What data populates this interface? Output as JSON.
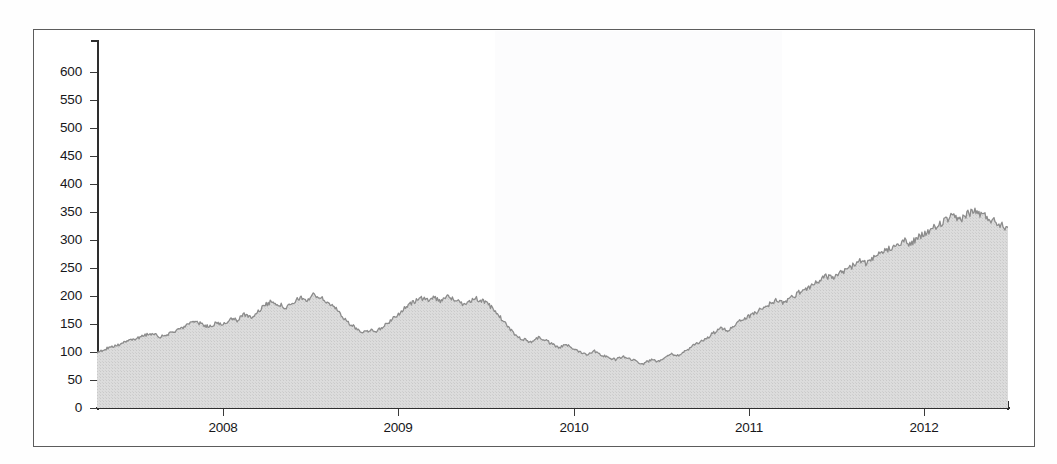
{
  "figure": {
    "background_color": "#ffffff",
    "frame_color": "#5c5c5c",
    "axis_color": "#2e2e2e"
  },
  "chart_data": {
    "type": "area",
    "title": "",
    "subtitle": "",
    "xlabel": "",
    "ylabel": "",
    "grid": false,
    "legend_position": "none",
    "fill_color": "#d6d6d6",
    "line_color": "#8c8c8c",
    "xlim": [
      2007.28,
      2012.48
    ],
    "ylim": [
      0,
      650
    ],
    "ytick_labels": [
      "0",
      "50",
      "100",
      "150",
      "200",
      "250",
      "300",
      "350",
      "400",
      "450",
      "500",
      "550",
      "600"
    ],
    "ytick_values": [
      0,
      50,
      100,
      150,
      200,
      250,
      300,
      350,
      400,
      450,
      500,
      550,
      600
    ],
    "xtick_labels": [
      "2008",
      "2009",
      "2010",
      "2011",
      "2012"
    ],
    "xtick_values": [
      2008,
      2009,
      2010,
      2011,
      2012
    ],
    "series": [
      {
        "name": "index",
        "x": [
          2007.28,
          2007.32,
          2007.36,
          2007.4,
          2007.44,
          2007.48,
          2007.52,
          2007.56,
          2007.6,
          2007.64,
          2007.68,
          2007.72,
          2007.76,
          2007.8,
          2007.84,
          2007.88,
          2007.92,
          2007.96,
          2008.0,
          2008.04,
          2008.08,
          2008.12,
          2008.16,
          2008.2,
          2008.24,
          2008.28,
          2008.32,
          2008.36,
          2008.4,
          2008.44,
          2008.48,
          2008.52,
          2008.56,
          2008.6,
          2008.64,
          2008.68,
          2008.72,
          2008.76,
          2008.8,
          2008.84,
          2008.88,
          2008.92,
          2008.96,
          2009.0,
          2009.04,
          2009.08,
          2009.12,
          2009.16,
          2009.2,
          2009.24,
          2009.28,
          2009.32,
          2009.36,
          2009.4,
          2009.44,
          2009.48,
          2009.52,
          2009.56,
          2009.6,
          2009.64,
          2009.68,
          2009.72,
          2009.76,
          2009.8,
          2009.84,
          2009.88,
          2009.92,
          2009.96,
          2010.0,
          2010.04,
          2010.08,
          2010.12,
          2010.16,
          2010.2,
          2010.24,
          2010.28,
          2010.32,
          2010.36,
          2010.4,
          2010.44,
          2010.48,
          2010.52,
          2010.56,
          2010.6,
          2010.64,
          2010.68,
          2010.72,
          2010.76,
          2010.8,
          2010.84,
          2010.88,
          2010.92,
          2010.96,
          2011.0,
          2011.04,
          2011.08,
          2011.12,
          2011.16,
          2011.2,
          2011.24,
          2011.28,
          2011.32,
          2011.36,
          2011.4,
          2011.44,
          2011.48,
          2011.52,
          2011.56,
          2011.6,
          2011.64,
          2011.68,
          2011.72,
          2011.76,
          2011.8,
          2011.84,
          2011.88,
          2011.92,
          2011.96,
          2012.0,
          2012.04,
          2012.08,
          2012.12,
          2012.16,
          2012.2,
          2012.24,
          2012.28,
          2012.32,
          2012.36,
          2012.4,
          2012.44,
          2012.48
        ],
        "values": [
          100,
          104,
          110,
          112,
          118,
          121,
          126,
          131,
          133,
          127,
          130,
          137,
          143,
          148,
          155,
          149,
          145,
          152,
          150,
          158,
          157,
          167,
          163,
          172,
          184,
          191,
          185,
          179,
          186,
          198,
          192,
          203,
          196,
          188,
          178,
          165,
          150,
          142,
          135,
          140,
          137,
          147,
          157,
          168,
          179,
          188,
          196,
          193,
          198,
          192,
          199,
          194,
          186,
          190,
          196,
          191,
          183,
          170,
          155,
          140,
          127,
          122,
          118,
          126,
          121,
          113,
          108,
          113,
          106,
          100,
          96,
          102,
          95,
          90,
          86,
          92,
          88,
          83,
          79,
          86,
          83,
          91,
          97,
          94,
          102,
          110,
          118,
          125,
          134,
          142,
          138,
          149,
          158,
          163,
          171,
          178,
          186,
          193,
          188,
          196,
          205,
          212,
          219,
          227,
          236,
          231,
          240,
          248,
          255,
          263,
          258,
          268,
          277,
          285,
          292,
          299,
          293,
          302,
          310,
          318,
          326,
          334,
          341,
          336,
          345,
          352,
          347,
          341,
          334,
          328,
          322
        ]
      }
    ],
    "notable_points": {
      "start_value": 100,
      "peak_2008": 203,
      "trough_2009": 78,
      "peak_2012": 628,
      "end_value": 575
    }
  },
  "axes": {
    "y_tick_count": 13,
    "x_tick_count": 5
  }
}
